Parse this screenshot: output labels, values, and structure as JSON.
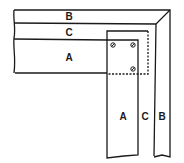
{
  "diagram": {
    "horizontal_member": {
      "labels": {
        "top": "B",
        "middle": "C",
        "bottom": "A"
      }
    },
    "vertical_member": {
      "labels": {
        "inner": "A",
        "middle": "C",
        "outer": "B"
      }
    },
    "fasteners": {
      "count": 3,
      "icon": "screw-icon"
    },
    "colors": {
      "line": "#1a1a1a",
      "background": "#ffffff"
    }
  }
}
